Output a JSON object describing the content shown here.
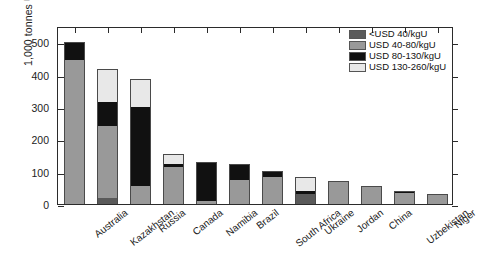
{
  "chart_data": {
    "type": "bar",
    "subtype": "stacked-bar",
    "title": "",
    "xlabel": "",
    "ylabel": "1,000 tonnes U",
    "ylim": [
      0,
      550
    ],
    "yticks": [
      0,
      100,
      200,
      300,
      400,
      500
    ],
    "ytick_labels": [
      "0",
      "100",
      "200",
      "300",
      "400",
      "500"
    ],
    "grid": false,
    "legend_position": "upper right",
    "categories": [
      "Australia",
      "Kazakhstan",
      "Russia",
      "Canada",
      "Namibia",
      "Brazil",
      "South Africa",
      "Ukraine",
      "Jordan",
      "China",
      "Uzbekistan",
      "Niger"
    ],
    "series": [
      {
        "name": "<USD 40/kgU",
        "color": "#5a5a5a",
        "values": [
          0,
          20,
          0,
          0,
          0,
          0,
          0,
          30,
          0,
          0,
          0,
          0
        ]
      },
      {
        "name": "USD 40-80/kgU",
        "color": "#999999",
        "values": [
          445,
          220,
          55,
          115,
          10,
          75,
          85,
          0,
          70,
          55,
          35,
          30
        ]
      },
      {
        "name": "USD 80-130/kgU",
        "color": "#111111",
        "values": [
          55,
          75,
          245,
          10,
          120,
          50,
          17,
          10,
          0,
          0,
          5,
          0
        ]
      },
      {
        "name": "USD 130-260/kgU",
        "color": "#e8e8e8",
        "values": [
          0,
          102,
          85,
          30,
          0,
          0,
          0,
          45,
          0,
          0,
          0,
          0
        ]
      }
    ],
    "totals": [
      500,
      417,
      385,
      155,
      130,
      125,
      102,
      85,
      70,
      55,
      40,
      30
    ],
    "legend": [
      {
        "label": "<USD 40/kgU",
        "color": "#5a5a5a"
      },
      {
        "label": "USD 40-80/kgU",
        "color": "#999999"
      },
      {
        "label": "USD 80-130/kgU",
        "color": "#111111"
      },
      {
        "label": "USD 130-260/kgU",
        "color": "#e8e8e8"
      }
    ]
  }
}
